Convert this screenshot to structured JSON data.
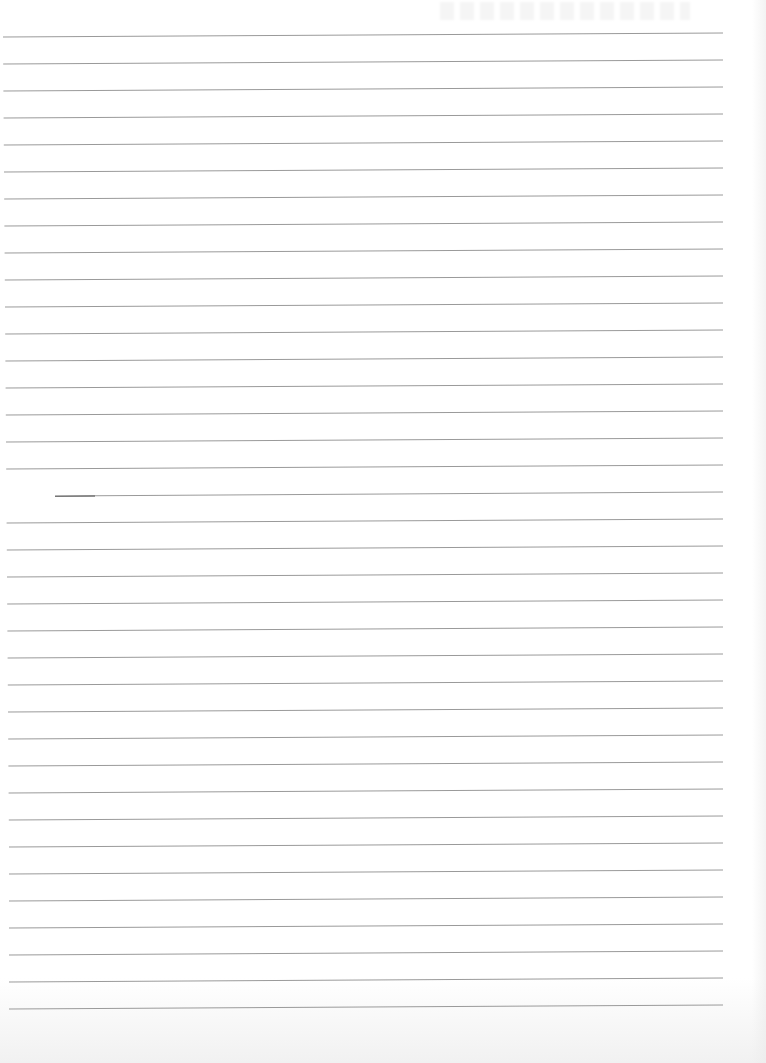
{
  "document": {
    "type": "ruled-notebook-page",
    "handwritten_text": "",
    "line_count": 37,
    "line_color": "#9a9a9a",
    "paper_color": "#ffffff",
    "first_line_y": 37,
    "line_spacing": 27,
    "line_left_x": 3,
    "line_right_x": 723
  }
}
